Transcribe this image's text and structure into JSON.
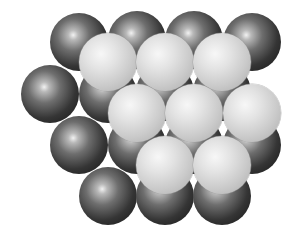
{
  "diagram": {
    "radius": 29,
    "colors": {
      "dark_layer": "#2a2a2a",
      "light_layer": "#d4d4d4",
      "background": "#ffffff"
    },
    "dark_layer": [
      {
        "x": 79,
        "y": 42
      },
      {
        "x": 137,
        "y": 40
      },
      {
        "x": 194,
        "y": 40
      },
      {
        "x": 252,
        "y": 42
      },
      {
        "x": 50,
        "y": 94
      },
      {
        "x": 108,
        "y": 94
      },
      {
        "x": 165,
        "y": 92
      },
      {
        "x": 222,
        "y": 92
      },
      {
        "x": 79,
        "y": 145
      },
      {
        "x": 137,
        "y": 145
      },
      {
        "x": 194,
        "y": 145
      },
      {
        "x": 252,
        "y": 145
      },
      {
        "x": 108,
        "y": 196
      },
      {
        "x": 165,
        "y": 196
      },
      {
        "x": 222,
        "y": 196
      }
    ],
    "light_layer": [
      {
        "x": 108,
        "y": 62
      },
      {
        "x": 165,
        "y": 62
      },
      {
        "x": 222,
        "y": 62
      },
      {
        "x": 137,
        "y": 113
      },
      {
        "x": 194,
        "y": 113
      },
      {
        "x": 252,
        "y": 113
      },
      {
        "x": 165,
        "y": 165
      },
      {
        "x": 222,
        "y": 165
      }
    ]
  }
}
